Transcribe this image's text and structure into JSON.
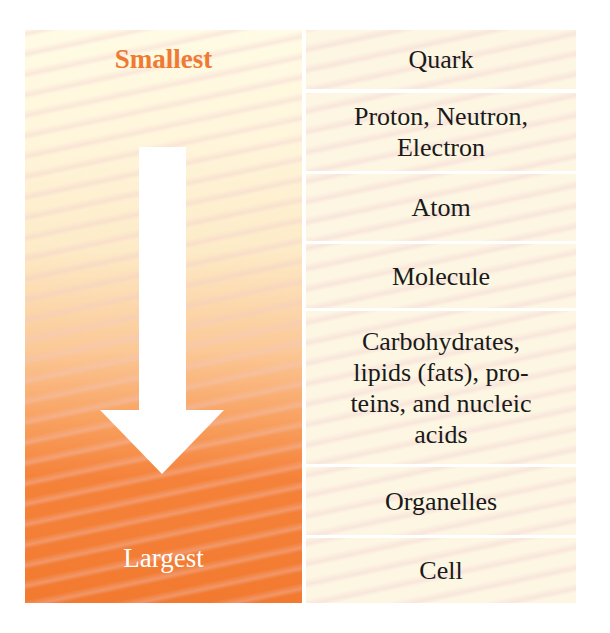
{
  "scale": {
    "top_label": "Smallest",
    "bottom_label": "Largest",
    "direction_icon": "down-arrow-icon",
    "colors": {
      "smallest_text": "#ee7a33",
      "largest_text": "#ffffff",
      "gradient_top": "#fffbe4",
      "gradient_bottom": "#f27a30",
      "row_background": "#fdf6e3"
    }
  },
  "levels": [
    {
      "label": "Quark"
    },
    {
      "label": "Proton, Neutron, Electron"
    },
    {
      "label": "Atom"
    },
    {
      "label": "Molecule"
    },
    {
      "label": "Carbohydrates, lipids (fats), pro-teins, and nucleic acids"
    },
    {
      "label": "Organelles"
    },
    {
      "label": "Cell"
    }
  ]
}
